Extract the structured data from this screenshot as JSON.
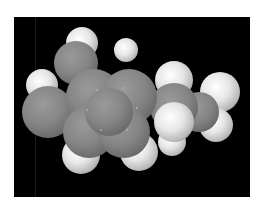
{
  "image": {
    "description": "Space-filling (CPK) molecular model of an alkylbenzene rendered in grayscale on a black background",
    "background_color": "#000000",
    "border_color": "#ffffff",
    "carbon_color": "#858585",
    "hydrogen_color": "#e6e6e6"
  },
  "atoms": [
    {
      "el": "H",
      "x": 68,
      "y": 26,
      "r": 16
    },
    {
      "el": "H",
      "x": 112,
      "y": 33,
      "r": 12
    },
    {
      "el": "H",
      "x": 28,
      "y": 68,
      "r": 16
    },
    {
      "el": "C",
      "x": 62,
      "y": 46,
      "r": 22
    },
    {
      "el": "C",
      "x": 34,
      "y": 95,
      "r": 26
    },
    {
      "el": "H",
      "x": 206,
      "y": 75,
      "r": 20
    },
    {
      "el": "H",
      "x": 202,
      "y": 108,
      "r": 17
    },
    {
      "el": "C",
      "x": 185,
      "y": 95,
      "r": 20
    },
    {
      "el": "H",
      "x": 158,
      "y": 125,
      "r": 14
    },
    {
      "el": "H",
      "x": 160,
      "y": 63,
      "r": 19
    },
    {
      "el": "C",
      "x": 160,
      "y": 90,
      "r": 24
    },
    {
      "el": "H",
      "x": 67,
      "y": 138,
      "r": 19
    },
    {
      "el": "H",
      "x": 125,
      "y": 135,
      "r": 19
    },
    {
      "el": "C",
      "x": 80,
      "y": 80,
      "r": 28
    },
    {
      "el": "C",
      "x": 115,
      "y": 80,
      "r": 28
    },
    {
      "el": "C",
      "x": 75,
      "y": 115,
      "r": 26
    },
    {
      "el": "C",
      "x": 110,
      "y": 115,
      "r": 26
    },
    {
      "el": "C",
      "x": 95,
      "y": 95,
      "r": 24
    },
    {
      "el": "H",
      "x": 160,
      "y": 105,
      "r": 20
    }
  ]
}
